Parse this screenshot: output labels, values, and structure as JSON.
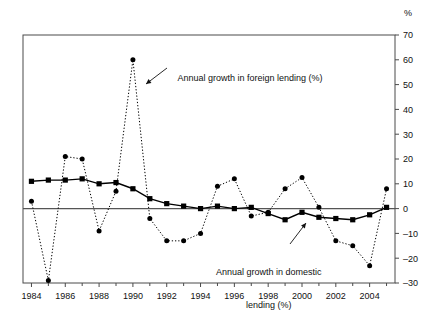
{
  "chart_data": {
    "type": "line",
    "title": "",
    "subtitle": "",
    "xlabel": "",
    "ylabel": "%",
    "unit_label": "%",
    "x": [
      1984,
      1985,
      1986,
      1987,
      1988,
      1989,
      1990,
      1991,
      1992,
      1993,
      1994,
      1995,
      1996,
      1997,
      1998,
      1999,
      2000,
      2001,
      2002,
      2003,
      2004,
      2005
    ],
    "xlim": [
      1983.5,
      2005.5
    ],
    "ylim": [
      -30,
      70
    ],
    "yticks": [
      -30,
      -20,
      -10,
      0,
      10,
      20,
      30,
      40,
      50,
      60,
      70
    ],
    "ytick_labels": [
      "–30",
      "–20",
      "–10",
      "0",
      "10",
      "20",
      "30",
      "40",
      "50",
      "60",
      "70"
    ],
    "xticks": [
      1984,
      1986,
      1988,
      1990,
      1992,
      1994,
      1996,
      1998,
      2000,
      2002,
      2004
    ],
    "xtick_labels": [
      "1984",
      "1986",
      "1988",
      "1990",
      "1992",
      "1994",
      "1996",
      "1998",
      "2000",
      "2002",
      "2004"
    ],
    "xminor_ticks": [
      1985,
      1987,
      1989,
      1991,
      1993,
      1995,
      1997,
      1999,
      2001,
      2003,
      2005
    ],
    "grid": false,
    "legend_position": "annotations",
    "axis_side": "right",
    "zero_line": 0,
    "series": [
      {
        "name": "Annual growth in foreign lending (%)",
        "style": "dotted",
        "marker": "circle",
        "color": "#000000",
        "values": [
          3,
          -29,
          21,
          20,
          -9,
          7,
          60,
          -4,
          -13,
          -13,
          -10,
          9,
          12,
          -3,
          -1.5,
          8,
          12.5,
          0.5,
          -13,
          -15,
          -23,
          8
        ]
      },
      {
        "name": "Annual growth in domestic lending (%)",
        "style": "solid",
        "marker": "square",
        "color": "#000000",
        "values": [
          11,
          11.5,
          11.5,
          12,
          10,
          10.5,
          8,
          4,
          2,
          1,
          0,
          1,
          0,
          0.5,
          -2,
          -4.5,
          -1.5,
          -3.5,
          -4,
          -4.5,
          -2.5,
          0.5
        ]
      }
    ],
    "annotations": [
      {
        "id": "foreign-annotation",
        "text": "Annual growth in foreign lending (%)",
        "lines": [
          "Annual growth in foreign lending (%)"
        ]
      },
      {
        "id": "domestic-annotation",
        "text": "Annual growth in domestic lending (%)",
        "lines": [
          "Annual growth in domestic",
          "lending (%)"
        ]
      }
    ]
  },
  "annotation_foreign_line1": "Annual growth in foreign lending (%)",
  "annotation_domestic_line1": "Annual growth in domestic",
  "annotation_domestic_line2": "lending (%)",
  "unit": "%"
}
